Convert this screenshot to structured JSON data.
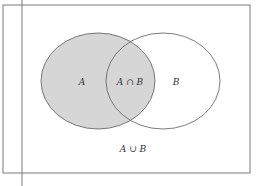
{
  "diagram": {
    "type": "venn",
    "sets": [
      {
        "id": "A",
        "label": "A",
        "shaded": true
      },
      {
        "id": "B",
        "label": "B",
        "shaded": false
      }
    ],
    "labels": {
      "set_a": "A",
      "intersection": "A ∩ B",
      "set_b": "B",
      "union": "A ∪ B"
    },
    "colors": {
      "shade": "#d6d6d6",
      "stroke": "#5a5a5a",
      "background": "#ffffff"
    }
  }
}
